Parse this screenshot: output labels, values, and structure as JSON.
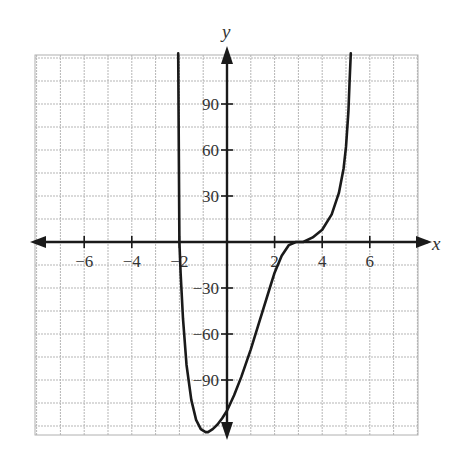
{
  "chart_data": {
    "type": "line",
    "title": "",
    "xlabel": "x",
    "ylabel": "y",
    "xlim": [
      -8,
      8
    ],
    "ylim": [
      -126,
      123
    ],
    "grid": true,
    "x_grid_step": 1,
    "y_grid_step": 15,
    "x_ticks": [
      -6,
      -4,
      -2,
      2,
      4,
      6
    ],
    "x_tick_labels": [
      "−6",
      "−4",
      "−2",
      "2",
      "4",
      "6"
    ],
    "y_ticks": [
      90,
      60,
      30,
      -30,
      -60,
      -90
    ],
    "y_tick_labels": [
      "90",
      "60",
      "30",
      "−30",
      "−60",
      "−90"
    ],
    "legend": null,
    "series": [
      {
        "name": "f(x)",
        "x": [
          -2.05,
          -2.0,
          -1.95,
          -1.85,
          -1.7,
          -1.5,
          -1.3,
          -1.1,
          -0.9,
          -0.8,
          -0.6,
          -0.4,
          -0.2,
          0.0,
          0.3,
          0.6,
          1.0,
          1.4,
          1.8,
          2.0,
          2.3,
          2.6,
          2.9,
          3.2,
          3.6,
          4.0,
          4.4,
          4.7,
          4.9,
          5.0,
          5.1,
          5.15,
          5.2
        ],
        "y": [
          123,
          0,
          -20,
          -50,
          -80,
          -103,
          -116,
          -122,
          -124,
          -124,
          -122,
          -119,
          -115,
          -110,
          -100,
          -88,
          -70,
          -50,
          -30,
          -20,
          -9,
          -2,
          0,
          0,
          3,
          8,
          18,
          32,
          48,
          62,
          85,
          105,
          123
        ]
      }
    ],
    "annotations": [
      {
        "text": "x",
        "position": "right end of x-axis"
      },
      {
        "text": "y",
        "position": "top of y-axis"
      }
    ]
  }
}
